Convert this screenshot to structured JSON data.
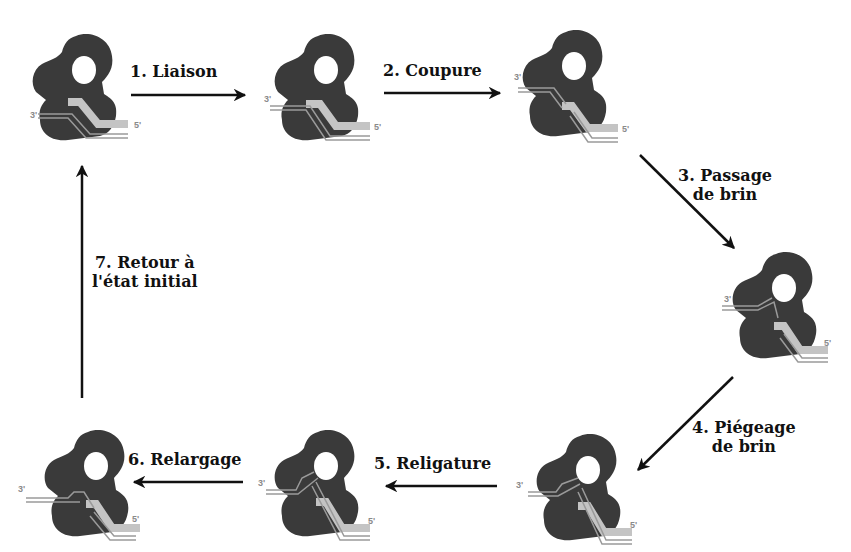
{
  "diagram": {
    "colors": {
      "enzyme": "#3a3a3a",
      "dna_strand": "#9a9a9a",
      "dna_gate_segment": "#c4c4c4",
      "arrow": "#111111",
      "text": "#111111",
      "end_label": "#8a8a8a"
    },
    "end_labels": {
      "three_prime": "3'",
      "five_prime": "5'"
    },
    "steps": [
      {
        "id": "step-1",
        "label_line1": "1. Liaison",
        "label_line2": ""
      },
      {
        "id": "step-2",
        "label_line1": "2. Coupure",
        "label_line2": ""
      },
      {
        "id": "step-3",
        "label_line1": "3. Passage",
        "label_line2": "de brin"
      },
      {
        "id": "step-4",
        "label_line1": "4. Piégeage",
        "label_line2": "de brin"
      },
      {
        "id": "step-5",
        "label_line1": "5. Religature",
        "label_line2": ""
      },
      {
        "id": "step-6",
        "label_line1": "6. Relargage",
        "label_line2": ""
      },
      {
        "id": "step-7",
        "label_line1": "7. Retour à",
        "label_line2": "l'état initial"
      }
    ],
    "states": [
      {
        "id": "state-initial",
        "position": "top-left"
      },
      {
        "id": "state-bound",
        "position": "top-middle"
      },
      {
        "id": "state-cleaved",
        "position": "top-right"
      },
      {
        "id": "state-passage",
        "position": "middle-right"
      },
      {
        "id": "state-trapped",
        "position": "bottom-right"
      },
      {
        "id": "state-religated",
        "position": "bottom-middle"
      },
      {
        "id": "state-released",
        "position": "bottom-left"
      }
    ]
  }
}
